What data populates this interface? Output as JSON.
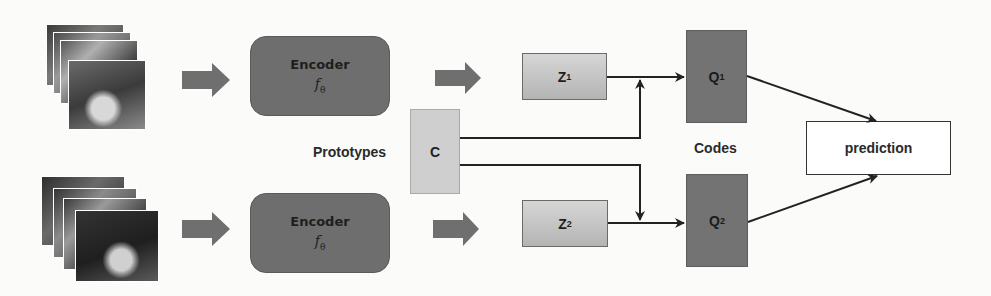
{
  "diagram": {
    "type": "architecture-flow",
    "branches": [
      {
        "input": {
          "name": "video-frames-1",
          "description": "stack of 4 video frames"
        },
        "encoder": {
          "label": "Encoder",
          "function": "f",
          "subscript": "θ"
        },
        "embedding": {
          "label": "Z",
          "subscript": "1"
        },
        "code": {
          "label": "Q",
          "subscript": "1"
        }
      },
      {
        "input": {
          "name": "video-frames-2",
          "description": "stack of 5 video frames"
        },
        "encoder": {
          "label": "Encoder",
          "function": "f",
          "subscript": "θ"
        },
        "embedding": {
          "label": "Z",
          "subscript": "2"
        },
        "code": {
          "label": "Q",
          "subscript": "2"
        }
      }
    ],
    "prototypes": {
      "label": "Prototypes",
      "box": "C"
    },
    "codes_label": "Codes",
    "output": {
      "label": "prediction"
    },
    "colors": {
      "encoder": "#6e6e6e",
      "embedding_top": "#d6d6d6",
      "embedding_bottom": "#b4b4b4",
      "prototypes": "#cfcfcf",
      "codes": "#737373",
      "arrow_block": "#6f6f6f",
      "line": "#222222"
    }
  }
}
